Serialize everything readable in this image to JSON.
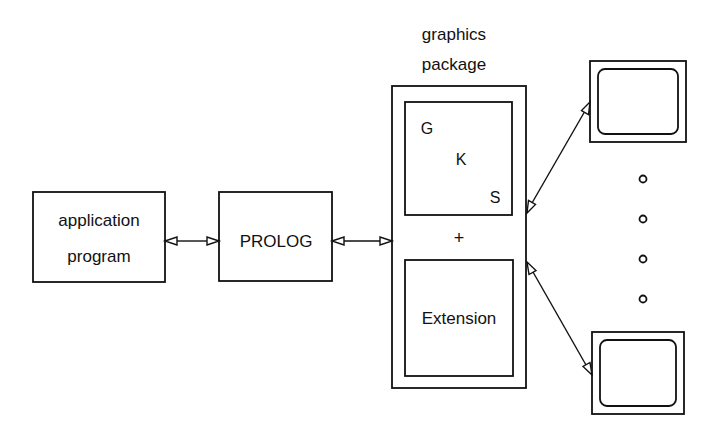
{
  "diagram": {
    "title_lines": [
      "graphics",
      "package"
    ],
    "nodes": {
      "application": {
        "lines": [
          "application",
          "program"
        ]
      },
      "prolog": {
        "label": "PROLOG"
      },
      "gks": {
        "letters": [
          "G",
          "K",
          "S"
        ]
      },
      "plus": {
        "label": "+"
      },
      "extension": {
        "label": "Extension"
      },
      "monitor_top": {
        "label": ""
      },
      "monitor_bottom": {
        "label": ""
      }
    },
    "ellipsis_dots": 4,
    "edges": [
      {
        "from": "application",
        "to": "prolog",
        "type": "bidirectional"
      },
      {
        "from": "prolog",
        "to": "graphics package",
        "type": "bidirectional"
      },
      {
        "from": "graphics package",
        "to": "monitor_top",
        "type": "bidirectional"
      },
      {
        "from": "graphics package",
        "to": "monitor_bottom",
        "type": "bidirectional"
      }
    ],
    "colors": {
      "stroke": "#111111",
      "background": "#ffffff"
    }
  }
}
